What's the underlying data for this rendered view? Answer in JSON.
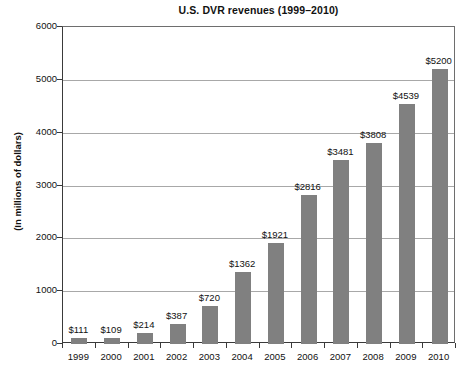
{
  "chart_data": {
    "type": "bar",
    "title": "U.S. DVR revenues (1999–2010)",
    "xlabel": "",
    "ylabel": "(In millions of dollars)",
    "categories": [
      "1999",
      "2000",
      "2001",
      "2002",
      "2003",
      "2004",
      "2005",
      "2006",
      "2007",
      "2008",
      "2009",
      "2010"
    ],
    "values": [
      111,
      109,
      214,
      387,
      720,
      1362,
      1921,
      2816,
      3481,
      3808,
      4539,
      5200
    ],
    "data_labels": [
      "$111",
      "$109",
      "$214",
      "$387",
      "$720",
      "$1362",
      "$1921",
      "$2816",
      "$3481",
      "$3808",
      "$4539",
      "$5200"
    ],
    "ylim": [
      0,
      6000
    ],
    "yticks": [
      0,
      1000,
      2000,
      3000,
      4000,
      5000,
      6000
    ],
    "ytick_labels": [
      "0",
      "1000",
      "2000",
      "3000",
      "4000",
      "5000",
      "6000"
    ],
    "grid": "horizontal",
    "legend": null,
    "bar_color": "#808080",
    "gridline_color": "#a8a8a8",
    "axis_color": "#3a3a3a",
    "text_color": "#111111"
  }
}
